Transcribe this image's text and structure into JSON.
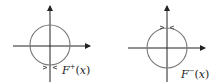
{
  "diagrams": [
    {
      "id": "left",
      "label_main": "F",
      "label_sup": "+",
      "label_open": "(",
      "label_var": "x",
      "label_close": ")",
      "arrows_at": "bottom",
      "circle_color": "#777777",
      "axis_color": "#222222"
    },
    {
      "id": "right",
      "label_main": "F",
      "label_sup": "−",
      "label_open": "(",
      "label_var": "x",
      "label_close": ")",
      "arrows_at": "top",
      "circle_color": "#777777",
      "axis_color": "#222222"
    }
  ]
}
